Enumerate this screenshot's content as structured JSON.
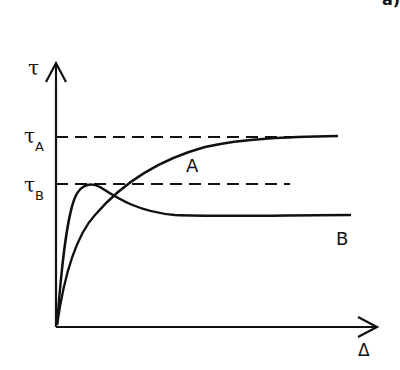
{
  "panel_label": "a)",
  "axes": {
    "y_label": "τ",
    "x_label": "Δ"
  },
  "levels": [
    {
      "symbol": "τ",
      "subscript": "A"
    },
    {
      "symbol": "τ",
      "subscript": "B"
    }
  ],
  "curves": [
    {
      "name": "A",
      "description": "monotonic rise approaching τA"
    },
    {
      "name": "B",
      "description": "rises to peak τB then softens to lower plateau"
    }
  ],
  "colors": {
    "ink": "#111111",
    "background": "#ffffff"
  }
}
